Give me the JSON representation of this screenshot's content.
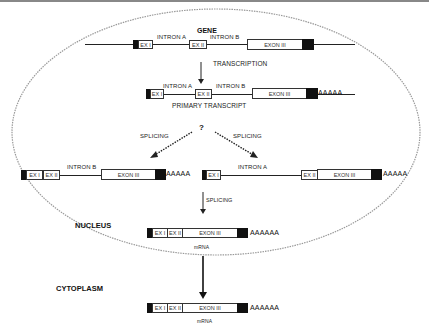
{
  "gene": {
    "title": "GENE",
    "exon1": "EX I",
    "intron_a": "INTRON A",
    "exon2": "EX II",
    "intron_b": "INTRON B",
    "exon3": "EXON III"
  },
  "transcription": {
    "label": "TRANSCRIPTION"
  },
  "primary_transcript": {
    "exon1": "EX I",
    "intron_a": "INTRON A",
    "exon2": "EX II",
    "intron_b": "INTRON B",
    "exon3": "EXON III",
    "poly_a": "AAAAA",
    "caption": "PRIMARY TRANSCRIPT"
  },
  "splicing_choice": {
    "question": "?",
    "left_label": "SPLICING",
    "right_label": "SPLICING"
  },
  "left_intermediate": {
    "exon1": "EX I",
    "exon2": "EX II",
    "intron_b": "INTRON B",
    "exon3": "EXON III",
    "poly_a": "AAAAA"
  },
  "right_intermediate": {
    "exon1": "EX I",
    "intron_a": "INTRON A",
    "exon2": "EX II",
    "exon3": "EXON III",
    "poly_a": "AAAAA",
    "splicing_label": "SPLICING"
  },
  "nucleus": {
    "label": "NUCLEUS",
    "mrna": {
      "exon1": "EX I",
      "exon2": "EX II",
      "exon3": "EXON III",
      "poly_a": "AAAAAA",
      "caption": "mRNA"
    }
  },
  "cytoplasm": {
    "label": "CYTOPLASM",
    "mrna": {
      "exon1": "EX I",
      "exon2": "EX II",
      "exon3": "EXON III",
      "poly_a": "AAAAAA",
      "caption": "mRNA"
    }
  }
}
